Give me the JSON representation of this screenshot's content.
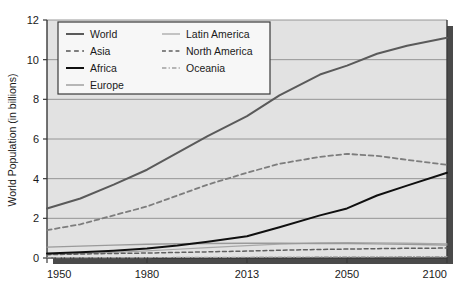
{
  "chart_data": {
    "type": "line",
    "title": "",
    "xlabel": "",
    "ylabel": "World Population (in billions)",
    "x": [
      1950,
      1980,
      2013,
      2050,
      2100
    ],
    "xtick_labels": [
      "1950",
      "1980",
      "2013",
      "2050",
      "2100"
    ],
    "ytick_labels": [
      "0",
      "2",
      "4",
      "6",
      "8",
      "10",
      "12"
    ],
    "yticks": [
      0,
      2,
      4,
      6,
      8,
      10,
      12
    ],
    "ylim": [
      0,
      12
    ],
    "grid": "horizontal",
    "legend_position": "top-left-inside",
    "legend_columns": 2,
    "series": [
      {
        "name": "World",
        "style": "solid",
        "color": "#5a5a5a",
        "width": 2.0,
        "values": [
          2.5,
          4.45,
          7.15,
          9.7,
          11.1
        ],
        "dense_x": [
          1950,
          1960,
          1970,
          1980,
          1990,
          2000,
          2013,
          2025,
          2040,
          2050,
          2065,
          2080,
          2100
        ],
        "dense_values": [
          2.5,
          3.0,
          3.7,
          4.45,
          5.3,
          6.15,
          7.15,
          8.2,
          9.25,
          9.7,
          10.3,
          10.7,
          11.1
        ]
      },
      {
        "name": "Asia",
        "style": "dashed",
        "color": "#7d7d7d",
        "width": 1.8,
        "values": [
          1.4,
          2.6,
          4.3,
          5.25,
          4.7
        ],
        "dense_x": [
          1950,
          1960,
          1970,
          1980,
          1990,
          2000,
          2013,
          2025,
          2040,
          2050,
          2065,
          2080,
          2100
        ],
        "dense_values": [
          1.4,
          1.7,
          2.15,
          2.6,
          3.15,
          3.7,
          4.3,
          4.75,
          5.1,
          5.25,
          5.15,
          4.95,
          4.7
        ]
      },
      {
        "name": "Africa",
        "style": "solid",
        "color": "#101010",
        "width": 2.0,
        "values": [
          0.23,
          0.48,
          1.1,
          2.5,
          4.3
        ],
        "dense_x": [
          1950,
          1960,
          1970,
          1980,
          1990,
          2000,
          2013,
          2025,
          2040,
          2050,
          2065,
          2080,
          2100
        ],
        "dense_values": [
          0.23,
          0.29,
          0.37,
          0.48,
          0.63,
          0.82,
          1.1,
          1.55,
          2.15,
          2.5,
          3.15,
          3.65,
          4.3
        ]
      },
      {
        "name": "Europe",
        "style": "solid",
        "color": "#9a9a9a",
        "width": 1.4,
        "values": [
          0.55,
          0.69,
          0.74,
          0.73,
          0.65
        ],
        "dense_x": [
          1950,
          1960,
          1970,
          1980,
          1990,
          2000,
          2013,
          2025,
          2040,
          2050,
          2065,
          2080,
          2100
        ],
        "dense_values": [
          0.55,
          0.6,
          0.65,
          0.69,
          0.72,
          0.73,
          0.74,
          0.74,
          0.73,
          0.73,
          0.71,
          0.69,
          0.65
        ]
      },
      {
        "name": "Latin America",
        "style": "solid",
        "color": "#a8a8a8",
        "width": 1.2,
        "values": [
          0.17,
          0.36,
          0.62,
          0.78,
          0.71
        ],
        "dense_x": [
          1950,
          1960,
          1970,
          1980,
          1990,
          2000,
          2013,
          2025,
          2040,
          2050,
          2065,
          2080,
          2100
        ],
        "dense_values": [
          0.17,
          0.22,
          0.28,
          0.36,
          0.44,
          0.52,
          0.62,
          0.7,
          0.76,
          0.78,
          0.77,
          0.75,
          0.71
        ]
      },
      {
        "name": "North America",
        "style": "dashed",
        "color": "#606060",
        "width": 1.5,
        "values": [
          0.17,
          0.25,
          0.35,
          0.45,
          0.5
        ],
        "dense_x": [
          1950,
          1960,
          1970,
          1980,
          1990,
          2000,
          2013,
          2025,
          2040,
          2050,
          2065,
          2080,
          2100
        ],
        "dense_values": [
          0.17,
          0.2,
          0.23,
          0.25,
          0.28,
          0.31,
          0.35,
          0.39,
          0.43,
          0.45,
          0.47,
          0.49,
          0.5
        ]
      },
      {
        "name": "Oceania",
        "style": "dashdot",
        "color": "#a0a0a0",
        "width": 1.2,
        "values": [
          0.013,
          0.023,
          0.038,
          0.057,
          0.07
        ],
        "dense_x": [
          1950,
          1960,
          1970,
          1980,
          1990,
          2000,
          2013,
          2025,
          2040,
          2050,
          2065,
          2080,
          2100
        ],
        "dense_values": [
          0.013,
          0.016,
          0.019,
          0.023,
          0.027,
          0.031,
          0.038,
          0.045,
          0.053,
          0.057,
          0.062,
          0.066,
          0.07
        ]
      }
    ]
  },
  "legend": {
    "entries": [
      {
        "label": "World"
      },
      {
        "label": "Latin America"
      },
      {
        "label": "Asia"
      },
      {
        "label": "North America"
      },
      {
        "label": "Africa"
      },
      {
        "label": "Oceania"
      },
      {
        "label": "Europe"
      }
    ]
  },
  "colors": {
    "plot_background": "#e2e2e2",
    "gridline": "#8c8c8c",
    "axis": "#3a3a3a",
    "shadow": "#4a4a4a",
    "legend_background": "#f7f7f7",
    "legend_border": "#3a3a3a",
    "page_background": "#ffffff",
    "text": "#1a1a1a"
  }
}
